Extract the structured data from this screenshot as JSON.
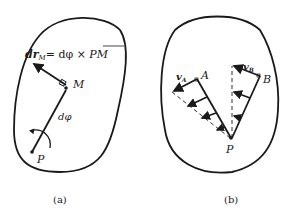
{
  "figure_a": {
    "equation_lhs": "dr",
    "equation_lhs_sub": "M",
    "equation_rhs": "= dφ × ",
    "equation_vec": "PM",
    "label_M": "M",
    "label_dphi": "dφ",
    "label_P": "P",
    "caption": "(a)"
  },
  "figure_b": {
    "label_vA": "v",
    "label_vA_sub": "A",
    "label_A": "A",
    "label_vB": "v",
    "label_vB_sub": "B",
    "label_B": "B",
    "label_P": "P",
    "caption": "(b)"
  },
  "colors": {
    "ink": "#1a1a1a",
    "background": "#ffffff"
  }
}
